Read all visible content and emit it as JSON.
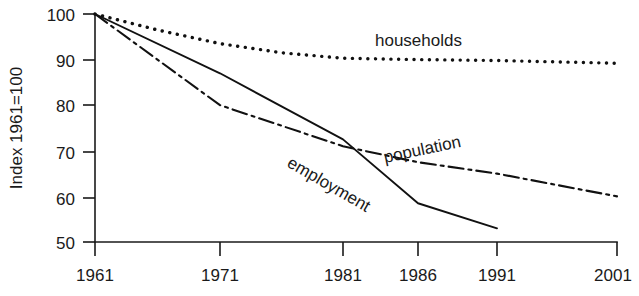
{
  "chart_data": {
    "type": "line",
    "title": "",
    "subtitle": "",
    "xlabel": "",
    "ylabel": "Index 1961=100",
    "grid": false,
    "legend_position": "inline-annotations",
    "x": [
      1961,
      1971,
      1981,
      1986,
      1991,
      2001
    ],
    "xticks": [
      "1961",
      "1971",
      "1981",
      "1986",
      "1991",
      "2001"
    ],
    "yticks": [
      "50",
      "60",
      "70",
      "80",
      "90",
      "100"
    ],
    "xlim": [
      1961,
      2001
    ],
    "ylim": [
      50,
      100
    ],
    "series": [
      {
        "name": "households",
        "style": "dotted",
        "label": "households",
        "x": [
          1961,
          1966,
          1971,
          1976,
          1981,
          1986,
          1991,
          1996,
          2001
        ],
        "values": [
          100,
          96.5,
          93.5,
          91.5,
          90.3,
          90.0,
          89.8,
          89.5,
          89.2
        ]
      },
      {
        "name": "population",
        "style": "dash-dot",
        "label": "population",
        "x": [
          1961,
          1971,
          1981,
          1986,
          1991,
          2001
        ],
        "values": [
          100,
          80,
          71,
          67.5,
          65,
          60
        ]
      },
      {
        "name": "employment",
        "style": "solid",
        "label": "employment",
        "x": [
          1961,
          1971,
          1981,
          1986,
          1991
        ],
        "values": [
          100,
          87,
          72.5,
          58.5,
          53
        ]
      }
    ],
    "annotations": [
      {
        "text": "households",
        "x": 1981,
        "y": 94,
        "rotation": 0
      },
      {
        "text": "population",
        "x": 1988,
        "y": 70,
        "rotation": -12
      },
      {
        "text": "employment",
        "x": 1978,
        "y": 65,
        "rotation": 30
      }
    ]
  },
  "axis": {
    "y_label": "Index 1961=100",
    "y_ticks": [
      "100",
      "90",
      "80",
      "70",
      "60",
      "50"
    ],
    "x_ticks": [
      "1961",
      "1971",
      "1981",
      "1986",
      "1991",
      "2001"
    ]
  },
  "labels": {
    "households": "households",
    "population": "population",
    "employment": "employment"
  },
  "colors": {
    "ink": "#1a1a1a",
    "background": "#ffffff"
  }
}
